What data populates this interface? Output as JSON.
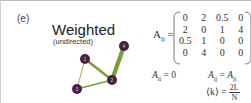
{
  "panel": {
    "label": "(e)",
    "title": "Weighted",
    "subtitle": "(undirected)"
  },
  "graph": {
    "node_color": "#4a2040",
    "edge_color": "#7a9e3a",
    "nodes": [
      {
        "id": "1",
        "x": 85,
        "y": 59
      },
      {
        "id": "2",
        "x": 112,
        "y": 80
      },
      {
        "id": "3",
        "x": 77,
        "y": 89
      },
      {
        "id": "4",
        "x": 124,
        "y": 46
      }
    ],
    "edges": [
      {
        "from": "1",
        "to": "2",
        "weight": 2
      },
      {
        "from": "2",
        "to": "4",
        "weight": 4
      },
      {
        "from": "1",
        "to": "3",
        "weight": 0.5
      },
      {
        "from": "3",
        "to": "2",
        "weight": 1
      }
    ]
  },
  "matrix": {
    "lhs": "A",
    "lhs_sub": "ij",
    "equals": "=",
    "rows": [
      [
        "0",
        "2",
        "0.5",
        "0"
      ],
      [
        "2",
        "0",
        "1",
        "4"
      ],
      [
        "0.5",
        "1",
        "0",
        "0"
      ],
      [
        "0",
        "4",
        "0",
        "0"
      ]
    ]
  },
  "equations": {
    "diag": "A",
    "diag_sub": "ii",
    "diag_rhs": " = 0",
    "sym_lhs": "A",
    "sym_lhs_sub": "ij",
    "sym_eq": " = ",
    "sym_rhs": "A",
    "sym_rhs_sub": "ji",
    "avg_lhs": "⟨k⟩ = ",
    "avg_num": "2L",
    "avg_den": "N"
  }
}
